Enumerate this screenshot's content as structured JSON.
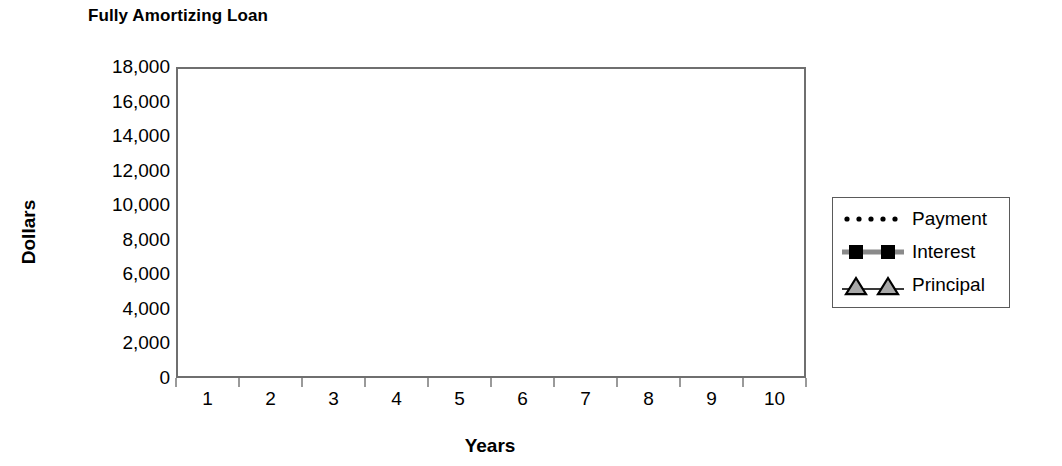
{
  "chart_data": {
    "type": "line",
    "title": "Fully Amortizing Loan",
    "xlabel": "Years",
    "ylabel": "Dollars",
    "categories": [
      1,
      2,
      3,
      4,
      5,
      6,
      7,
      8,
      9,
      10
    ],
    "x_tick_labels": [
      "1",
      "2",
      "3",
      "4",
      "5",
      "6",
      "7",
      "8",
      "9",
      "10"
    ],
    "y_tick_labels": [
      "0",
      "2,000",
      "4,000",
      "6,000",
      "8,000",
      "10,000",
      "12,000",
      "14,000",
      "16,000",
      "18,000"
    ],
    "y_tick_values": [
      0,
      2000,
      4000,
      6000,
      8000,
      10000,
      12000,
      14000,
      16000,
      18000
    ],
    "ylim": [
      0,
      18000
    ],
    "grid": "horizontal",
    "legend_position": "right-outside",
    "series": [
      {
        "name": "Payment",
        "style": "dotted",
        "marker": "none",
        "color": "#000000",
        "values": [
          16450,
          16465,
          16480,
          16495,
          16510,
          16525,
          16545,
          16565,
          16590,
          16620
        ]
      },
      {
        "name": "Interest",
        "style": "solid-thick",
        "marker": "square",
        "color": "#8a8a8a",
        "marker_color": "#000000",
        "values": [
          9900,
          9500,
          8950,
          8300,
          7750,
          6900,
          6100,
          5000,
          3700,
          1900
        ]
      },
      {
        "name": "Principal",
        "style": "solid-thin",
        "marker": "triangle",
        "color": "#3a3a3a",
        "marker_color": "#a8a8a8",
        "values": [
          6800,
          7150,
          7550,
          8400,
          8950,
          9850,
          10800,
          12000,
          13250,
          14850
        ]
      }
    ]
  },
  "legend": {
    "items": [
      {
        "label": "Payment"
      },
      {
        "label": "Interest"
      },
      {
        "label": "Principal"
      }
    ]
  }
}
